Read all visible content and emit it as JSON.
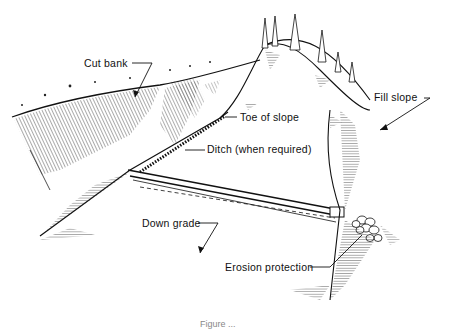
{
  "diagram": {
    "type": "road cross-section illustration",
    "labels": {
      "cut_bank": "Cut bank",
      "fill_slope": "Fill slope",
      "toe_of_slope": "Toe of slope",
      "ditch": "Ditch (when required)",
      "down_grade": "Down grade",
      "erosion_protection": "Erosion protection"
    },
    "caption": "Figure ..."
  }
}
